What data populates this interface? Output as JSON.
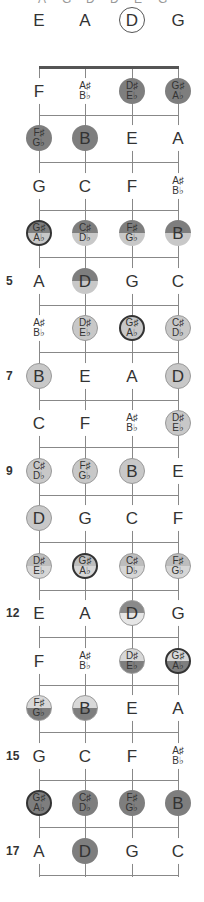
{
  "title_clipped": [
    "A",
    "G",
    "D",
    "D",
    "E",
    "G"
  ],
  "strings": [
    "E",
    "A",
    "D",
    "G"
  ],
  "string_x": [
    39,
    85,
    132,
    178
  ],
  "nut_y": 67,
  "fret_spacing": 47.5,
  "fret_markers": {
    "5": "5",
    "7": "7",
    "9": "9",
    "12": "12",
    "15": "15",
    "17": "17"
  },
  "rows": [
    {
      "fret": 0,
      "cells": [
        {
          "n": "E",
          "s": "plain"
        },
        {
          "n": "A",
          "s": "plain"
        },
        {
          "n": "D",
          "s": "open"
        },
        {
          "n": "G",
          "s": "plain"
        }
      ]
    },
    {
      "fret": 1,
      "cells": [
        {
          "n": "F",
          "s": "plain"
        },
        {
          "n": "A♯",
          "b": "B♭",
          "s": "plain"
        },
        {
          "n": "D♯",
          "b": "E♭",
          "s": "dark"
        },
        {
          "n": "G♯",
          "b": "A♭",
          "s": "dark"
        }
      ]
    },
    {
      "fret": 2,
      "cells": [
        {
          "n": "F♯",
          "b": "G♭",
          "s": "dark"
        },
        {
          "n": "B",
          "s": "dark"
        },
        {
          "n": "E",
          "s": "plain"
        },
        {
          "n": "A",
          "s": "plain"
        }
      ]
    },
    {
      "fret": 3,
      "cells": [
        {
          "n": "G",
          "s": "plain"
        },
        {
          "n": "C",
          "s": "plain"
        },
        {
          "n": "F",
          "s": "plain"
        },
        {
          "n": "A♯",
          "b": "B♭",
          "s": "plain"
        }
      ]
    },
    {
      "fret": 4,
      "cells": [
        {
          "n": "G♯",
          "b": "A♭",
          "s": "split-dl thick"
        },
        {
          "n": "C♯",
          "b": "D♭",
          "s": "split-dl"
        },
        {
          "n": "F♯",
          "b": "G♭",
          "s": "split-dl"
        },
        {
          "n": "B",
          "s": "split-dl"
        }
      ]
    },
    {
      "fret": 5,
      "cells": [
        {
          "n": "A",
          "s": "plain"
        },
        {
          "n": "D",
          "s": "split-dl"
        },
        {
          "n": "G",
          "s": "plain"
        },
        {
          "n": "C",
          "s": "plain"
        }
      ]
    },
    {
      "fret": 6,
      "cells": [
        {
          "n": "A♯",
          "b": "B♭",
          "s": "plain"
        },
        {
          "n": "D♯",
          "b": "E♭",
          "s": "light"
        },
        {
          "n": "G♯",
          "b": "A♭",
          "s": "light thick"
        },
        {
          "n": "C♯",
          "b": "D♭",
          "s": "light"
        }
      ]
    },
    {
      "fret": 7,
      "cells": [
        {
          "n": "B",
          "s": "light"
        },
        {
          "n": "E",
          "s": "plain"
        },
        {
          "n": "A",
          "s": "plain"
        },
        {
          "n": "D",
          "s": "light"
        }
      ]
    },
    {
      "fret": 8,
      "cells": [
        {
          "n": "C",
          "s": "plain"
        },
        {
          "n": "F",
          "s": "plain"
        },
        {
          "n": "A♯",
          "b": "B♭",
          "s": "plain"
        },
        {
          "n": "D♯",
          "b": "E♭",
          "s": "light"
        }
      ]
    },
    {
      "fret": 9,
      "cells": [
        {
          "n": "C♯",
          "b": "D♭",
          "s": "light"
        },
        {
          "n": "F♯",
          "b": "G♭",
          "s": "light"
        },
        {
          "n": "B",
          "s": "light"
        },
        {
          "n": "E",
          "s": "plain"
        }
      ]
    },
    {
      "fret": 10,
      "cells": [
        {
          "n": "D",
          "s": "light"
        },
        {
          "n": "G",
          "s": "plain"
        },
        {
          "n": "C",
          "s": "plain"
        },
        {
          "n": "F",
          "s": "plain"
        }
      ]
    },
    {
      "fret": 11,
      "cells": [
        {
          "n": "D♯",
          "b": "E♭",
          "s": "split-ll"
        },
        {
          "n": "G♯",
          "b": "A♭",
          "s": "split-ll thick"
        },
        {
          "n": "C♯",
          "b": "D♭",
          "s": "split-ll"
        },
        {
          "n": "F♯",
          "b": "G♭",
          "s": "split-ll"
        }
      ]
    },
    {
      "fret": 12,
      "cells": [
        {
          "n": "E",
          "s": "plain"
        },
        {
          "n": "A",
          "s": "plain"
        },
        {
          "n": "D",
          "s": "split-dw"
        },
        {
          "n": "G",
          "s": "plain"
        }
      ]
    },
    {
      "fret": 13,
      "cells": [
        {
          "n": "F",
          "s": "plain"
        },
        {
          "n": "A♯",
          "b": "B♭",
          "s": "plain"
        },
        {
          "n": "D♯",
          "b": "E♭",
          "s": "split-ld"
        },
        {
          "n": "G♯",
          "b": "A♭",
          "s": "split-ld thick"
        }
      ]
    },
    {
      "fret": 14,
      "cells": [
        {
          "n": "F♯",
          "b": "G♭",
          "s": "split-ld"
        },
        {
          "n": "B",
          "s": "split-ld"
        },
        {
          "n": "E",
          "s": "plain"
        },
        {
          "n": "A",
          "s": "plain"
        }
      ]
    },
    {
      "fret": 15,
      "cells": [
        {
          "n": "G",
          "s": "plain"
        },
        {
          "n": "C",
          "s": "plain"
        },
        {
          "n": "F",
          "s": "plain"
        },
        {
          "n": "A♯",
          "b": "B♭",
          "s": "plain"
        }
      ]
    },
    {
      "fret": 16,
      "cells": [
        {
          "n": "G♯",
          "b": "A♭",
          "s": "dark thick"
        },
        {
          "n": "C♯",
          "b": "D♭",
          "s": "dark"
        },
        {
          "n": "F♯",
          "b": "G♭",
          "s": "dark"
        },
        {
          "n": "B",
          "s": "dark"
        }
      ]
    },
    {
      "fret": 17,
      "cells": [
        {
          "n": "A",
          "s": "plain"
        },
        {
          "n": "D",
          "s": "dark"
        },
        {
          "n": "G",
          "s": "plain"
        },
        {
          "n": "C",
          "s": "plain"
        }
      ]
    }
  ],
  "colors": {
    "dark": "#7e7e7e",
    "light": "#c8c8c8",
    "line": "#888888",
    "nut": "#555555"
  }
}
